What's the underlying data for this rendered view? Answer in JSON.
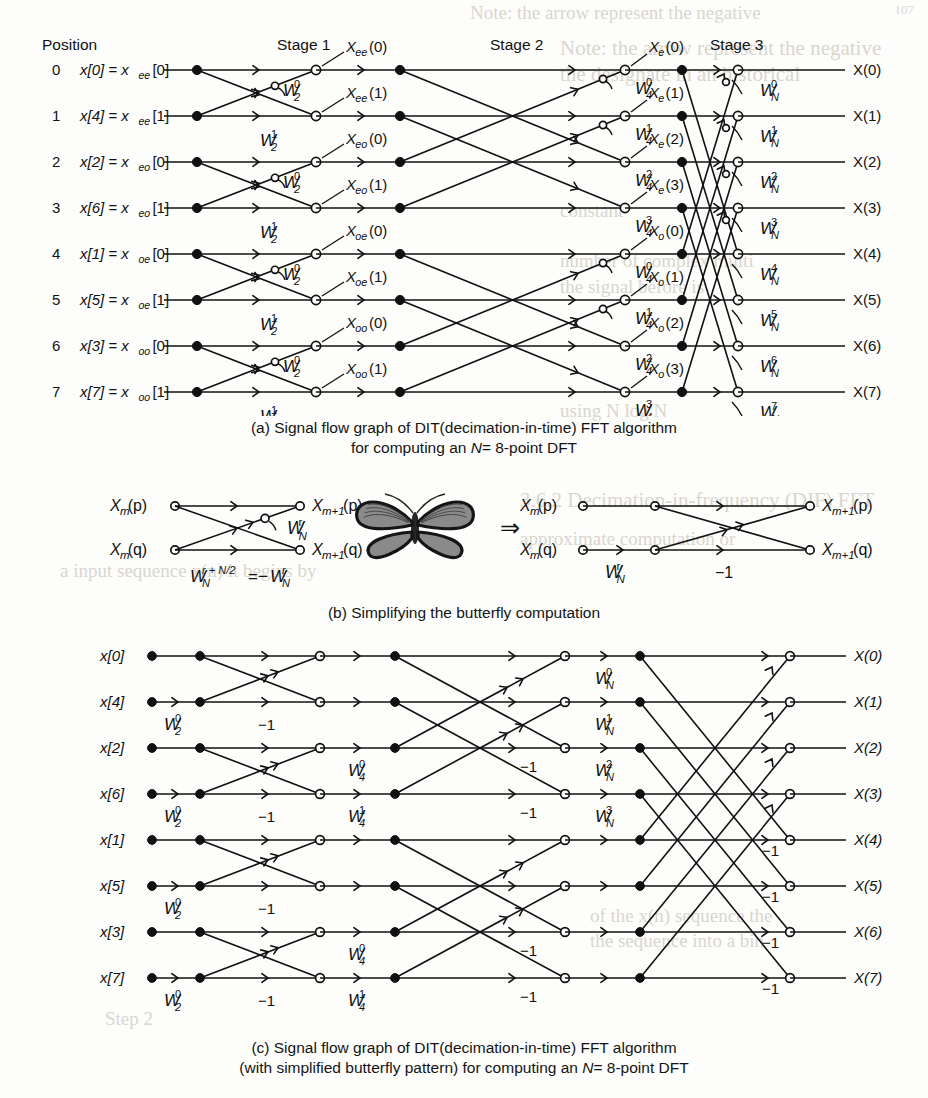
{
  "page": {
    "number": "107"
  },
  "figure_a": {
    "header_position": "Position",
    "stages": [
      "Stage 1",
      "Stage 2",
      "Stage 3"
    ],
    "rows": [
      {
        "index": "0",
        "input": "x[0] = x",
        "input_sub": "ee",
        "input_tail": "[0]"
      },
      {
        "index": "1",
        "input": "x[4] = x",
        "input_sub": "ee",
        "input_tail": "[1]"
      },
      {
        "index": "2",
        "input": "x[2] = x",
        "input_sub": "eo",
        "input_tail": "[0]"
      },
      {
        "index": "3",
        "input": "x[6] = x",
        "input_sub": "eo",
        "input_tail": "[1]"
      },
      {
        "index": "4",
        "input": "x[1] = x",
        "input_sub": "oe",
        "input_tail": "[0]"
      },
      {
        "index": "5",
        "input": "x[5] = x",
        "input_sub": "oe",
        "input_tail": "[1]"
      },
      {
        "index": "6",
        "input": "x[3] = x",
        "input_sub": "oo",
        "input_tail": "[0]"
      },
      {
        "index": "7",
        "input": "x[7] = x",
        "input_sub": "oo",
        "input_tail": "[1]"
      }
    ],
    "stage1_outputs": [
      {
        "base": "X",
        "sub": "ee",
        "arg": "(0)"
      },
      {
        "base": "X",
        "sub": "ee",
        "arg": "(1)"
      },
      {
        "base": "X",
        "sub": "eo",
        "arg": "(0)"
      },
      {
        "base": "X",
        "sub": "eo",
        "arg": "(1)"
      },
      {
        "base": "X",
        "sub": "oe",
        "arg": "(0)"
      },
      {
        "base": "X",
        "sub": "oe",
        "arg": "(1)"
      },
      {
        "base": "X",
        "sub": "oo",
        "arg": "(0)"
      },
      {
        "base": "X",
        "sub": "oo",
        "arg": "(1)"
      }
    ],
    "stage2_outputs": [
      {
        "base": "X",
        "sub": "e",
        "arg": "(0)"
      },
      {
        "base": "X",
        "sub": "e",
        "arg": "(1)"
      },
      {
        "base": "X",
        "sub": "e",
        "arg": "(2)"
      },
      {
        "base": "X",
        "sub": "e",
        "arg": "(3)"
      },
      {
        "base": "X",
        "sub": "o",
        "arg": "(0)"
      },
      {
        "base": "X",
        "sub": "o",
        "arg": "(1)"
      },
      {
        "base": "X",
        "sub": "o",
        "arg": "(2)"
      },
      {
        "base": "X",
        "sub": "o",
        "arg": "(3)"
      }
    ],
    "stage3_outputs": [
      "X(0)",
      "X(1)",
      "X(2)",
      "X(3)",
      "X(4)",
      "X(5)",
      "X(6)",
      "X(7)"
    ],
    "stage1_twiddles_upper": [
      "W 2 0",
      "W 2 0",
      "W 2 0",
      "W 2 0"
    ],
    "stage1_twiddles_lower": [
      "W 2 1",
      "W 2 1",
      "W 2 1",
      "W 2 1"
    ],
    "twiddle_W2_0": {
      "sym": "W",
      "sub": "2",
      "sup": "0"
    },
    "twiddle_W2_1": {
      "sym": "W",
      "sub": "2",
      "sup": "1"
    },
    "stage2_twiddles": [
      {
        "sym": "W",
        "sub": "4",
        "sup": "0"
      },
      {
        "sym": "W",
        "sub": "4",
        "sup": "1"
      },
      {
        "sym": "W",
        "sub": "4",
        "sup": "2"
      },
      {
        "sym": "W",
        "sub": "4",
        "sup": "3"
      },
      {
        "sym": "W",
        "sub": "4",
        "sup": "0"
      },
      {
        "sym": "W",
        "sub": "4",
        "sup": "1"
      },
      {
        "sym": "W",
        "sub": "4",
        "sup": "2"
      },
      {
        "sym": "W",
        "sub": "4",
        "sup": "3"
      }
    ],
    "stage3_twiddles": [
      {
        "sym": "W",
        "sub": "N",
        "sup": "0"
      },
      {
        "sym": "W",
        "sub": "N",
        "sup": "1"
      },
      {
        "sym": "W",
        "sub": "N",
        "sup": "2"
      },
      {
        "sym": "W",
        "sub": "N",
        "sup": "3"
      },
      {
        "sym": "W",
        "sub": "N",
        "sup": "4"
      },
      {
        "sym": "W",
        "sub": "N",
        "sup": "5"
      },
      {
        "sym": "W",
        "sub": "N",
        "sup": "6"
      },
      {
        "sym": "W",
        "sub": "N",
        "sup": "7"
      }
    ],
    "caption_line1": "(a) Signal flow graph of DIT(decimation-in-time) FFT algorithm",
    "caption_line2_pre": "for computing an ",
    "caption_line2_it": "N",
    "caption_line2_post": "= 8-point DFT"
  },
  "figure_b": {
    "left": {
      "in_top": {
        "base": "X",
        "sub": "m",
        "arg": "(p)"
      },
      "in_bot": {
        "base": "X",
        "sub": "m",
        "arg": "(q)"
      },
      "out_top": {
        "base": "X",
        "sub": "m+1",
        "arg": "(p)"
      },
      "out_bot": {
        "base": "X",
        "sub": "m+1",
        "arg": "(q)"
      },
      "twiddle": {
        "sym": "W",
        "sub": "N",
        "sup": "r"
      },
      "identity_lhs": {
        "sym": "W",
        "sub": "N",
        "sup": "r + N/2"
      },
      "identity_rhs": "= −W",
      "identity_rhs_sub": "N",
      "identity_rhs_sup": "r"
    },
    "arrow": "⇒",
    "butterfly_icon": "butterfly",
    "right": {
      "in_top": {
        "base": "X",
        "sub": "m",
        "arg": "(p)"
      },
      "in_bot": {
        "base": "X",
        "sub": "m",
        "arg": "(q)"
      },
      "out_top": {
        "base": "X",
        "sub": "m+1",
        "arg": "(p)"
      },
      "out_bot": {
        "base": "X",
        "sub": "m+1",
        "arg": "(q)"
      },
      "twiddle": {
        "sym": "W",
        "sub": "N",
        "sup": "r"
      },
      "minus_one": "−1"
    },
    "caption": "(b) Simplifying the butterfly computation"
  },
  "figure_c": {
    "inputs": [
      "x[0]",
      "x[4]",
      "x[2]",
      "x[6]",
      "x[1]",
      "x[5]",
      "x[3]",
      "x[7]"
    ],
    "outputs": [
      "X(0)",
      "X(1)",
      "X(2)",
      "X(3)",
      "X(4)",
      "X(5)",
      "X(6)",
      "X(7)"
    ],
    "stage1_twiddle": {
      "sym": "W",
      "sub": "2",
      "sup": "0"
    },
    "stage1_twiddle_count": 4,
    "stage2_twiddles": [
      {
        "sym": "W",
        "sub": "4",
        "sup": "0"
      },
      {
        "sym": "W",
        "sub": "4",
        "sup": "1"
      },
      {
        "sym": "W",
        "sub": "4",
        "sup": "0"
      },
      {
        "sym": "W",
        "sub": "4",
        "sup": "1"
      }
    ],
    "stage3_twiddles": [
      {
        "sym": "W",
        "sub": "N",
        "sup": "0"
      },
      {
        "sym": "W",
        "sub": "N",
        "sup": "1"
      },
      {
        "sym": "W",
        "sub": "N",
        "sup": "2"
      },
      {
        "sym": "W",
        "sub": "N",
        "sup": "3"
      }
    ],
    "minus_one": "−1",
    "caption_line1": "(c) Signal flow graph of DIT(decimation-in-time) FFT algorithm",
    "caption_line2_pre": "(with simplified butterfly pattern) for computing an ",
    "caption_line2_it": "N",
    "caption_line2_post": "= 8-point DFT"
  },
  "bleed_text": {
    "lines": [
      "Note:  the  arrow  represent  the  negative",
      "the   designate   in   an   historical",
      "constant",
      "number of complex  multi",
      "the  signal  before  is",
      "using  N   log  N",
      "3.6.2  Decimation-in-frequency (DIF) FFT",
      "approximate  computation  or",
      "a input sequence x(n) it begins by",
      "of the x(n)  sequence  the",
      "the  sequence  into  a  bin",
      "Step 2"
    ]
  }
}
